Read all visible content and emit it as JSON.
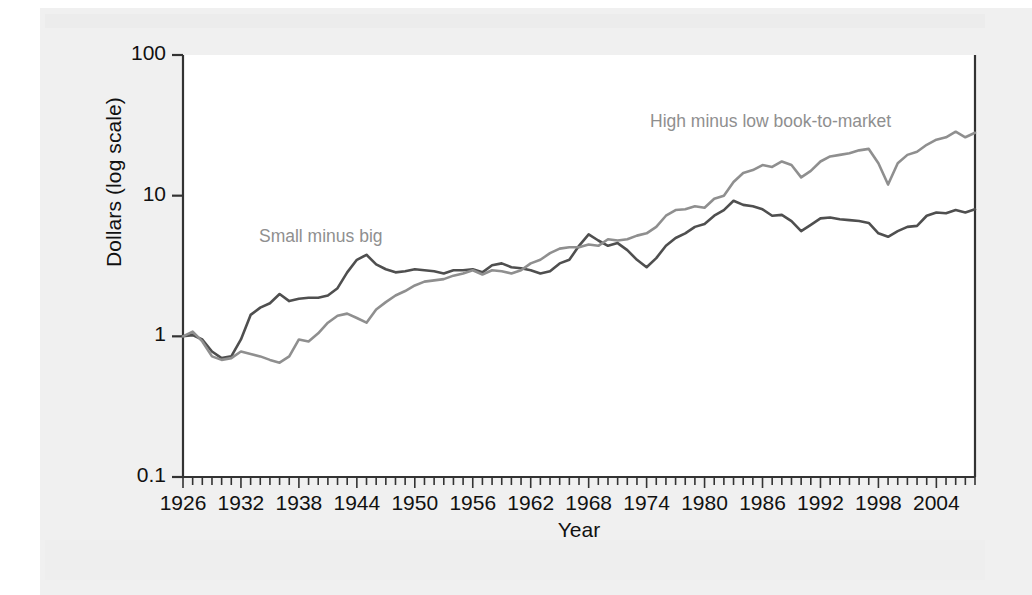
{
  "chart_data": {
    "type": "line",
    "title": "",
    "xlabel": "Year",
    "ylabel": "Dollars (log scale)",
    "yscale": "log",
    "ylim": [
      0.1,
      100
    ],
    "xlim": [
      1926,
      2008
    ],
    "ytick_labels": [
      "100",
      "10",
      "1",
      "0.1"
    ],
    "ytick_values": [
      100,
      10,
      1,
      0.1
    ],
    "xtick_labels": [
      "1926",
      "1932",
      "1938",
      "1944",
      "1950",
      "1956",
      "1962",
      "1968",
      "1974",
      "1980",
      "1986",
      "1992",
      "1998",
      "2004"
    ],
    "xtick_values": [
      1926,
      1932,
      1938,
      1944,
      1950,
      1956,
      1962,
      1968,
      1974,
      1980,
      1986,
      1992,
      1998,
      2004
    ],
    "minor_tick_interval": 1,
    "grid": false,
    "legend": "annotations-inline",
    "annotations": [
      {
        "text": "Small minus big",
        "series": "Small minus big",
        "x": 1938,
        "y": 4.0
      },
      {
        "text": "High minus low book-to-market",
        "series": "High minus low book-to-market",
        "x": 1988,
        "y": 38
      }
    ],
    "x": [
      1926,
      1927,
      1928,
      1929,
      1930,
      1931,
      1932,
      1933,
      1934,
      1935,
      1936,
      1937,
      1938,
      1939,
      1940,
      1941,
      1942,
      1943,
      1944,
      1945,
      1946,
      1947,
      1948,
      1949,
      1950,
      1951,
      1952,
      1953,
      1954,
      1955,
      1956,
      1957,
      1958,
      1959,
      1960,
      1961,
      1962,
      1963,
      1964,
      1965,
      1966,
      1967,
      1968,
      1969,
      1970,
      1971,
      1972,
      1973,
      1974,
      1975,
      1976,
      1977,
      1978,
      1979,
      1980,
      1981,
      1982,
      1983,
      1984,
      1985,
      1986,
      1987,
      1988,
      1989,
      1990,
      1991,
      1992,
      1993,
      1994,
      1995,
      1996,
      1997,
      1998,
      1999,
      2000,
      2001,
      2002,
      2003,
      2004,
      2005,
      2006,
      2007,
      2008
    ],
    "series": [
      {
        "name": "Small minus big",
        "color": "#4f4f4f",
        "values": [
          1.0,
          1.02,
          0.95,
          0.78,
          0.7,
          0.72,
          0.95,
          1.42,
          1.6,
          1.72,
          2.0,
          1.78,
          1.85,
          1.88,
          1.88,
          1.95,
          2.2,
          2.85,
          3.5,
          3.8,
          3.25,
          3.0,
          2.85,
          2.9,
          3.0,
          2.95,
          2.9,
          2.8,
          2.95,
          2.95,
          3.0,
          2.85,
          3.2,
          3.3,
          3.1,
          3.05,
          2.95,
          2.8,
          2.9,
          3.3,
          3.5,
          4.4,
          5.3,
          4.8,
          4.4,
          4.6,
          4.1,
          3.5,
          3.1,
          3.6,
          4.4,
          5.0,
          5.4,
          6.0,
          6.3,
          7.2,
          7.9,
          9.2,
          8.6,
          8.4,
          8.0,
          7.2,
          7.3,
          6.6,
          5.6,
          6.2,
          6.9,
          7.0,
          6.8,
          6.7,
          6.6,
          6.4,
          5.4,
          5.1,
          5.6,
          6.0,
          6.1,
          7.2,
          7.6,
          7.5,
          7.9,
          7.6,
          8.0
        ]
      },
      {
        "name": "High minus low book-to-market",
        "color": "#8f8f8f",
        "values": [
          1.0,
          1.08,
          0.92,
          0.72,
          0.68,
          0.7,
          0.78,
          0.75,
          0.72,
          0.68,
          0.65,
          0.72,
          0.95,
          0.92,
          1.05,
          1.25,
          1.4,
          1.45,
          1.35,
          1.25,
          1.55,
          1.75,
          1.95,
          2.1,
          2.3,
          2.45,
          2.5,
          2.55,
          2.7,
          2.8,
          2.95,
          2.75,
          2.95,
          2.9,
          2.8,
          2.95,
          3.3,
          3.5,
          3.9,
          4.2,
          4.3,
          4.3,
          4.5,
          4.4,
          4.9,
          4.8,
          4.9,
          5.2,
          5.4,
          6.0,
          7.2,
          7.9,
          8.0,
          8.4,
          8.2,
          9.5,
          10.0,
          12.5,
          14.5,
          15.2,
          16.5,
          16.0,
          17.5,
          16.5,
          13.5,
          15.0,
          17.5,
          19.0,
          19.5,
          20.0,
          21.0,
          21.5,
          17.0,
          12.0,
          17.0,
          19.5,
          20.5,
          23.0,
          25.0,
          26.0,
          28.5,
          26.0,
          28.0
        ]
      }
    ]
  }
}
